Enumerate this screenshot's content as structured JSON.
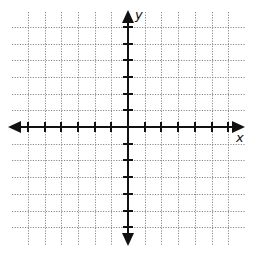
{
  "diagram": {
    "type": "coordinate-plane",
    "axes": {
      "x_label": "x",
      "y_label": "y",
      "x_range": [
        -6,
        6
      ],
      "y_range": [
        -6,
        6
      ],
      "tick_step": 1,
      "arrows": "both-ends"
    },
    "grid": {
      "style": "dotted",
      "color": "#8a8a8a",
      "unit_px": 16.7,
      "origin_px": [
        128,
        127
      ],
      "extent_px": {
        "left": 12,
        "right": 245,
        "top": 12,
        "bottom": 245
      }
    },
    "colors": {
      "axis": "#111111",
      "background": "#ffffff"
    }
  }
}
